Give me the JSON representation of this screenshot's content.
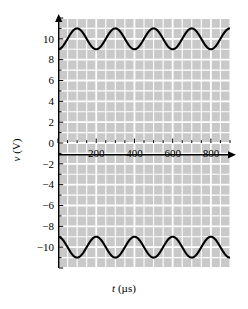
{
  "chart_data": {
    "type": "line",
    "title": "",
    "xlabel": "t (µs)",
    "ylabel": "v (V)",
    "xlabel_var": "t",
    "xlabel_unit": "(µs)",
    "ylabel_var": "v",
    "ylabel_unit": "(V)",
    "xlim": [
      0,
      900
    ],
    "ylim": [
      -12,
      12
    ],
    "grid": true,
    "grid_color": "#ffffff",
    "plot_background": "#c9c9c9",
    "line_color": "#000000",
    "legend": "none",
    "xticks": [
      200,
      400,
      600,
      800
    ],
    "xtick_labels": [
      "200",
      "400",
      "600",
      "800"
    ],
    "xtick_minor_step": 50,
    "yticks": [
      -10,
      -8,
      -6,
      -4,
      -2,
      0,
      2,
      4,
      6,
      8,
      10
    ],
    "ytick_labels": [
      "-10",
      "-8",
      "-6",
      "-4",
      "-2",
      "0",
      "2",
      "4",
      "6",
      "8",
      "10"
    ],
    "ytick_minor_step": 1,
    "series": [
      {
        "name": "upper-waveform",
        "form": "sine",
        "offset": 10,
        "amplitude": 1,
        "period": 200,
        "phase_deg": 0,
        "peaks_t": [
          100,
          300,
          500,
          700,
          900
        ],
        "troughs_t": [
          0,
          200,
          400,
          600,
          800
        ],
        "min": 9,
        "max": 11
      },
      {
        "name": "lower-waveform",
        "form": "sine",
        "offset": -10,
        "amplitude": 1,
        "period": 200,
        "phase_deg": 180,
        "peaks_t": [
          0,
          200,
          400,
          600,
          800
        ],
        "troughs_t": [
          100,
          300,
          500,
          700,
          900
        ],
        "min": -11,
        "max": -9
      }
    ]
  }
}
